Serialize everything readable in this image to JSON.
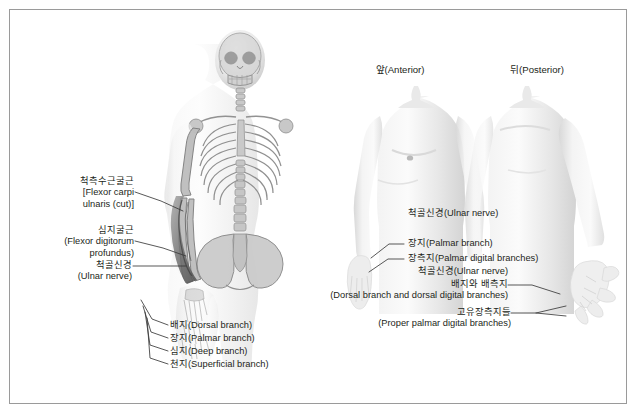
{
  "figure": {
    "background_color": "#ffffff",
    "border_color": "#9a9a9a",
    "text_color": "#231f20"
  },
  "panels": {
    "left": {
      "name": "skeleton-anterior-view",
      "description": "Translucent full-body skeleton, anterior view, with left forearm musculature highlighted"
    },
    "right": {
      "anterior_title": "앞(Anterior)",
      "posterior_title": "뒤(Posterior)"
    }
  },
  "left_labels": [
    {
      "id": "flexor-carpi-ulnaris",
      "lines": [
        "척측수근굴근",
        "[Flexor carpi",
        "ulnaris (cut)]"
      ],
      "align": "right"
    },
    {
      "id": "flexor-digitorum-profundus",
      "lines": [
        "심지굴근",
        "(Flexor digitorum",
        "profundus)"
      ],
      "align": "right"
    },
    {
      "id": "ulnar-nerve-left",
      "lines": [
        "척골신경",
        "(Ulnar nerve)"
      ],
      "align": "right"
    }
  ],
  "hand_branch_labels": [
    {
      "id": "dorsal-branch",
      "lines": [
        "배지(Dorsal branch)"
      ]
    },
    {
      "id": "palmar-branch",
      "lines": [
        "장지(Palmar branch)"
      ]
    },
    {
      "id": "deep-branch",
      "lines": [
        "심지(Deep branch)"
      ]
    },
    {
      "id": "superficial-branch",
      "lines": [
        "천지(Superficial branch)"
      ]
    }
  ],
  "right_labels": [
    {
      "id": "ulnar-nerve-anterior",
      "lines": [
        "척골신경(Ulnar nerve)"
      ],
      "align": "left"
    },
    {
      "id": "palmar-branch-right",
      "lines": [
        "장지(Palmar branch)"
      ],
      "align": "left"
    },
    {
      "id": "palmar-digital-branches",
      "lines": [
        "장측지(Palmar digital branches)"
      ],
      "align": "left"
    },
    {
      "id": "ulnar-nerve-posterior",
      "lines": [
        "척골신경(Ulnar nerve)"
      ],
      "align": "right"
    },
    {
      "id": "dorsal-and-dorsal-digital-branches",
      "lines": [
        "배지와 배측지",
        "(Dorsal branch and dorsal digital branches)"
      ],
      "align": "right"
    },
    {
      "id": "proper-palmar-digital-branches",
      "lines": [
        "고유장측지들",
        "(Proper palmar digital branches)"
      ],
      "align": "right"
    }
  ]
}
